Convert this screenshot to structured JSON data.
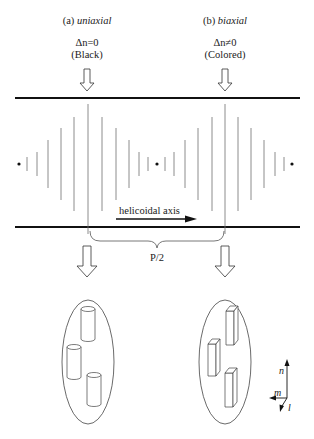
{
  "labels": {
    "a_prefix": "(a) ",
    "a_name": "uniaxial",
    "a_condition": "Δn=0",
    "a_color": "(Black)",
    "b_prefix": "(b) ",
    "b_name": "biaxial",
    "b_condition": "Δn≠0",
    "b_color": "(Colored)",
    "axis_label": "helicoidal axis",
    "pitch_label": "P/2"
  },
  "axes_triad": {
    "n": "n",
    "m": "m",
    "l": "l"
  },
  "icons": {
    "down_arrow": "hollow-down-arrow",
    "right_arrow": "solid-right-arrow",
    "cylinder": "cylinder-molecule",
    "prism": "rectangular-prism-molecule"
  },
  "colors": {
    "ink": "#1a1a1a",
    "line": "#6e6e6e",
    "background": "#ffffff"
  }
}
